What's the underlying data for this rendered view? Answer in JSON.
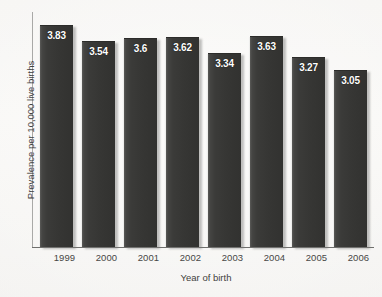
{
  "chart_data": {
    "type": "bar",
    "title": "",
    "subtitle": "",
    "xlabel": "Year of birth",
    "ylabel": "Prevalence per 10,000 live births",
    "categories": [
      "1999",
      "2000",
      "2001",
      "2002",
      "2003",
      "2004",
      "2005",
      "2006"
    ],
    "values": [
      3.83,
      3.54,
      3.6,
      3.62,
      3.34,
      3.63,
      3.27,
      3.05
    ],
    "value_labels": [
      "3.83",
      "3.54",
      "3.6",
      "3.62",
      "3.34",
      "3.63",
      "3.27",
      "3.05"
    ],
    "ylim": [
      0,
      4.05
    ],
    "y_tick_labels": [],
    "grid": false,
    "legend": false,
    "legend_position": "none",
    "orientation": "vertical",
    "data_label_position": "inside-top",
    "series": [
      {
        "name": "Prevalence per 10,000 live births",
        "values": [
          3.83,
          3.54,
          3.6,
          3.62,
          3.34,
          3.63,
          3.27,
          3.05
        ]
      }
    ]
  },
  "style": {
    "bar_color": "#383836",
    "bar_edge_highlight": "#fdfdfc",
    "data_label_color": "#ffffff",
    "axis_line_color": "#6f6f6d",
    "background_color": "#f8f7f5",
    "text_color": "#3f3f3d"
  }
}
